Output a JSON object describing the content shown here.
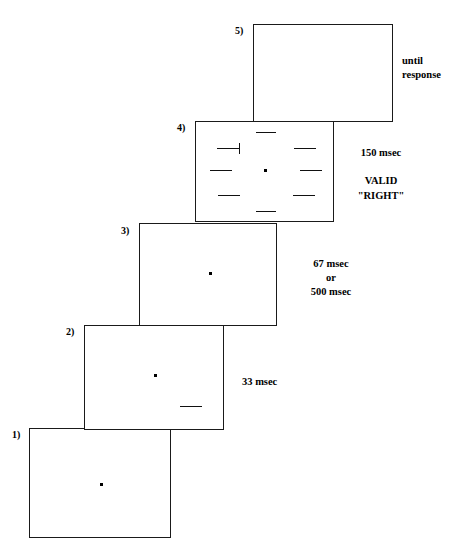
{
  "figure": {
    "background_color": "#ffffff",
    "line_color": "#111111"
  },
  "panels": [
    {
      "id": "panel-1",
      "label": "1)",
      "has_fixation_dot": true,
      "annotation": null
    },
    {
      "id": "panel-2",
      "label": "2)",
      "has_fixation_dot": true,
      "annotation": {
        "lines": [
          "33 msec"
        ],
        "align": "left"
      }
    },
    {
      "id": "panel-3",
      "label": "3)",
      "has_fixation_dot": true,
      "annotation": {
        "lines": [
          "67 msec",
          "or",
          "500 msec"
        ],
        "align": "center"
      }
    },
    {
      "id": "panel-4",
      "label": "4)",
      "has_fixation_dot": true,
      "annotation": {
        "lines": [
          "150 msec",
          "",
          "VALID",
          "\"RIGHT\""
        ],
        "align": "center"
      }
    },
    {
      "id": "panel-5",
      "label": "5)",
      "has_fixation_dot": false,
      "annotation": {
        "lines": [
          "until",
          "response"
        ],
        "align": "left"
      }
    }
  ],
  "annotations": {
    "panel_2_duration": "33 msec",
    "panel_3_duration_first": "67 msec",
    "panel_3_duration_conjunction": "or",
    "panel_3_duration_second": "500 msec",
    "panel_4_duration": "150 msec",
    "panel_4_validity": "VALID",
    "panel_4_response": "\"RIGHT\"",
    "panel_5_duration_line1": "until",
    "panel_5_duration_line2": "response"
  },
  "labels": {
    "panel_1": "1)",
    "panel_2": "2)",
    "panel_3": "3)",
    "panel_4": "4)",
    "panel_5": "5)"
  }
}
